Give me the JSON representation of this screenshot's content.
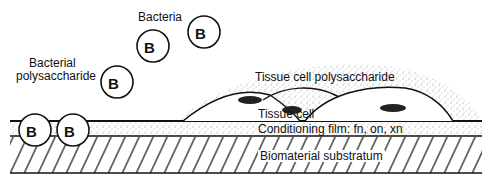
{
  "labels": {
    "bacteria": "Bacteria",
    "bacterial_polysaccharide_1": "Bacterial",
    "bacterial_polysaccharide_2": "polysaccharide",
    "tissue_cell_polysaccharide": "Tissue cell polysaccharide",
    "tissue_cell": "Tissue cell",
    "conditioning_film": "Conditioning film: fn, on, xn",
    "biomaterial_substratum": "Biomaterial substratum"
  },
  "bacterium_letter": "B",
  "bacteria": [
    {
      "cx": 38,
      "cy": 130
    },
    {
      "cx": 75,
      "cy": 130
    },
    {
      "cx": 117,
      "cy": 82
    },
    {
      "cx": 153,
      "cy": 46
    },
    {
      "cx": 204,
      "cy": 32
    }
  ]
}
